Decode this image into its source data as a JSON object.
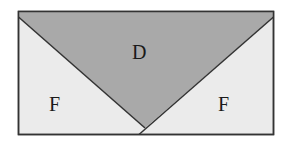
{
  "diagram": {
    "regions": [
      {
        "id": "top",
        "label": "D",
        "fill": "#a9a9a9"
      },
      {
        "id": "left",
        "label": "F",
        "fill": "#ebebeb"
      },
      {
        "id": "right",
        "label": "F",
        "fill": "#ebebeb"
      }
    ],
    "stroke": "#333333"
  }
}
